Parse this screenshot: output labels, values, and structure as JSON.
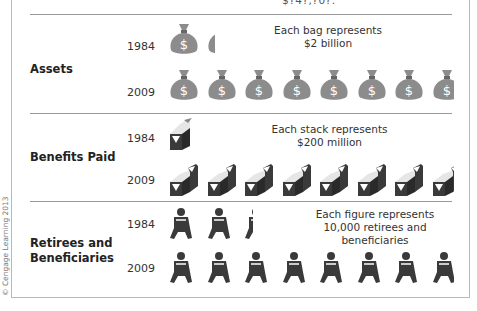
{
  "header": {
    "caption_fragment": "$?4?,?0?."
  },
  "copyright": "© Cengage Learning 2013",
  "colors": {
    "bag": "#8c8c8c",
    "stack_dark": "#3a3a3a",
    "stack_light": "#e6e6e6",
    "figure": "#3a3a3a",
    "separator": "#9a9a9a"
  },
  "chart_data": {
    "type": "pictograph",
    "title": "",
    "categories": [
      "1984",
      "2009"
    ],
    "groups": [
      {
        "name": "Assets",
        "icon": "money-bag",
        "unit_note": [
          "Each bag represents",
          "$2 billion"
        ],
        "unit_value": 2,
        "unit_label": "$ billion",
        "icon_counts": {
          "1984": 1.3,
          "2009": 7.6
        },
        "visible_icons": {
          "1984": 2,
          "2009": 8
        }
      },
      {
        "name": "Benefits Paid",
        "icon": "cash-stack",
        "unit_note": [
          "Each stack represents",
          "$200 million"
        ],
        "unit_value": 200,
        "unit_label": "$ million",
        "icon_counts": {
          "1984": 1.2,
          "2009": 7.5
        },
        "visible_icons": {
          "1984": 1,
          "2009": 8
        }
      },
      {
        "name": "Retirees and Beneficiaries",
        "icon": "person-figure",
        "unit_note": [
          "Each figure represents",
          "10,000 retirees and beneficiaries"
        ],
        "unit_value": 10000,
        "unit_label": "retirees and beneficiaries",
        "icon_counts": {
          "1984": 2.3,
          "2009": 7.3
        },
        "visible_icons": {
          "1984": 3,
          "2009": 8
        }
      }
    ]
  },
  "sections": {
    "assets": {
      "label": "Assets",
      "year_a": "1984",
      "year_b": "2009",
      "note_1": "Each bag represents",
      "note_2": "$2 billion"
    },
    "benefits": {
      "label": "Benefits Paid",
      "year_a": "1984",
      "year_b": "2009",
      "note_1": "Each stack represents",
      "note_2": "$200 million"
    },
    "retirees": {
      "label_1": "Retirees and",
      "label_2": "Beneficiaries",
      "year_a": "1984",
      "year_b": "2009",
      "note_1": "Each figure represents",
      "note_2": "10,000 retirees and beneficiaries"
    }
  }
}
